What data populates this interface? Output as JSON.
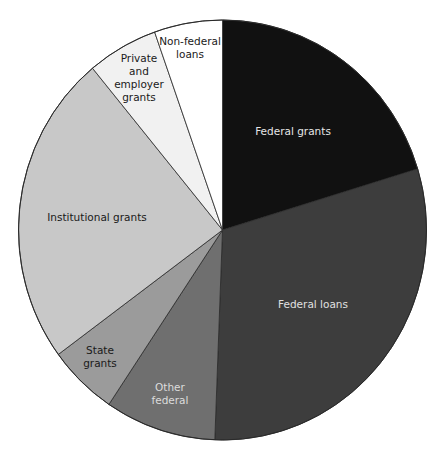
{
  "chart_data": {
    "type": "pie",
    "title": "",
    "start_angle_deg": 0,
    "direction": "clockwise",
    "slices": [
      {
        "label": "Federal grants",
        "lines": [
          "Federal grants"
        ],
        "value": 20.3,
        "color": "#111111",
        "text_color": "#e6e6e6",
        "label_pos": [
          293,
          131
        ]
      },
      {
        "label": "Federal loans",
        "lines": [
          "Federal loans"
        ],
        "value": 30.3,
        "color": "#3d3d3d",
        "text_color": "#e0e0e0",
        "label_pos": [
          313,
          304
        ]
      },
      {
        "label": "Other federal",
        "lines": [
          "Other",
          "federal"
        ],
        "value": 8.8,
        "color": "#6f6f6f",
        "text_color": "#dcdcdc",
        "label_pos": [
          170,
          393
        ]
      },
      {
        "label": "State grants",
        "lines": [
          "State",
          "grants"
        ],
        "value": 5.5,
        "color": "#9b9b9b",
        "text_color": "#1a1a1a",
        "label_pos": [
          100,
          356
        ]
      },
      {
        "label": "Institutional grants",
        "lines": [
          "Institutional grants"
        ],
        "value": 24.1,
        "color": "#c8c8c8",
        "text_color": "#1a1a1a",
        "label_pos": [
          97,
          217
        ]
      },
      {
        "label": "Private and employer grants",
        "lines": [
          "Private",
          "and",
          "employer",
          "grants"
        ],
        "value": 5.6,
        "color": "#f1f1f1",
        "text_color": "#1a1a1a",
        "label_pos": [
          139,
          77
        ]
      },
      {
        "label": "Non-federal loans",
        "lines": [
          "Non-federal",
          "loans"
        ],
        "value": 5.4,
        "color": "#ffffff",
        "text_color": "#1a1a1a",
        "label_pos": [
          190,
          47
        ]
      }
    ],
    "legend": "none (labels inside slices)",
    "stroke_color": "#2a2a2a"
  },
  "labels": {
    "federal_grants": "Federal grants",
    "federal_loans": "Federal loans",
    "other_federal": "Other federal",
    "state_grants": "State grants",
    "institutional_grants": "Institutional grants",
    "private_employer_grants": "Private and employer grants",
    "non_federal_loans": "Non-federal loans"
  }
}
